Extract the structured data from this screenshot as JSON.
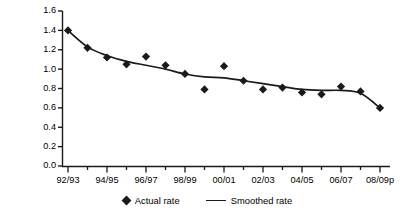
{
  "chart_data": {
    "type": "line",
    "title": "",
    "xlabel": "",
    "ylabel": "Rate per 100,000",
    "ylim": [
      0.0,
      1.6
    ],
    "ytick_labels": [
      "0.0",
      "0.2",
      "0.4",
      "0.6",
      "0.8",
      "1.0",
      "1.2",
      "1.4",
      "1.6"
    ],
    "ytick_values": [
      0.0,
      0.2,
      0.4,
      0.6,
      0.8,
      1.0,
      1.2,
      1.4,
      1.6
    ],
    "categories": [
      "92/93",
      "93/94",
      "94/95",
      "95/96",
      "96/97",
      "97/98",
      "98/99",
      "99/00",
      "00/01",
      "01/02",
      "02/03",
      "03/04",
      "04/05",
      "05/06",
      "06/07",
      "07/08",
      "08/09p"
    ],
    "xtick_labels": [
      "92/93",
      "94/95",
      "96/97",
      "98/99",
      "00/01",
      "02/03",
      "04/05",
      "06/07",
      "08/09p"
    ],
    "xtick_label_indices": [
      0,
      2,
      4,
      6,
      8,
      10,
      12,
      14,
      16
    ],
    "grid": false,
    "legend_position": "bottom",
    "series": [
      {
        "name": "Actual rate",
        "marker": "diamond",
        "style": "points",
        "values": [
          1.4,
          1.22,
          1.12,
          1.05,
          1.13,
          1.04,
          0.95,
          0.79,
          1.03,
          0.88,
          0.79,
          0.81,
          0.76,
          0.74,
          0.82,
          0.77,
          0.6
        ]
      },
      {
        "name": "Smoothed rate",
        "marker": "none",
        "style": "line",
        "values": [
          1.4,
          1.23,
          1.14,
          1.08,
          1.04,
          1.0,
          0.95,
          0.92,
          0.91,
          0.88,
          0.85,
          0.82,
          0.79,
          0.78,
          0.78,
          0.75,
          0.6
        ]
      }
    ]
  },
  "legend": {
    "items": [
      {
        "label": "Actual rate",
        "marker": "diamond-marker-icon"
      },
      {
        "label": "Smoothed rate",
        "marker": "line-marker-icon"
      }
    ]
  },
  "colors": {
    "ink": "#1a1a1a",
    "background": "#ffffff"
  }
}
